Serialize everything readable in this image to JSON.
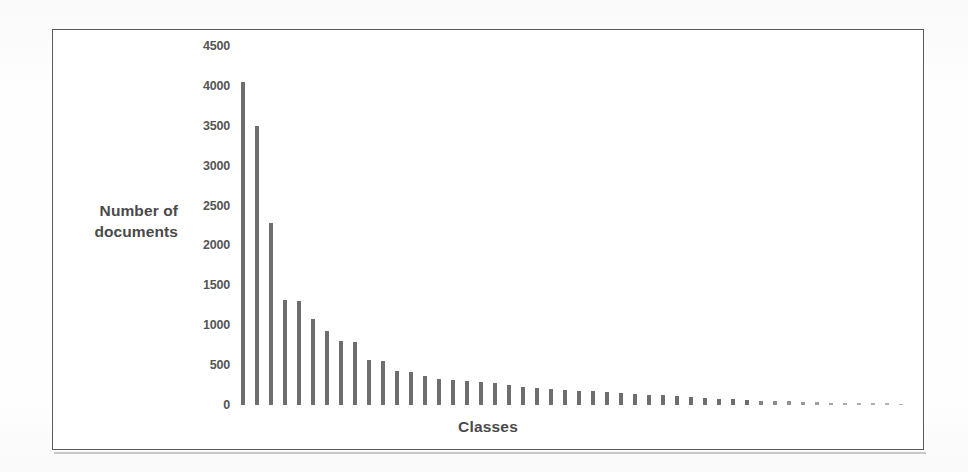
{
  "figure": {
    "frame_color": "#5b5b5b",
    "background": "#ffffff",
    "bar_color": "#6e6e6e",
    "text_color": "#4a4a4a"
  },
  "axes": {
    "y_title_line1": "Number of",
    "y_title_line2": "documents",
    "x_title": "Classes",
    "y_ticks": [
      "4500",
      "4000",
      "3500",
      "3000",
      "2500",
      "2000",
      "1500",
      "1000",
      "500",
      "0"
    ]
  },
  "chart_data": {
    "type": "bar",
    "title": "",
    "subtitle": "",
    "xlabel": "Classes",
    "ylabel": "Number of documents",
    "ylim": [
      0,
      4500
    ],
    "ytick_values": [
      0,
      500,
      1000,
      1500,
      2000,
      2500,
      3000,
      3500,
      4000,
      4500
    ],
    "grid": false,
    "legend": false,
    "legend_position": "none",
    "xtick_labels": [],
    "annotations": [],
    "note": "Long-tailed (Zipf-like) distribution of number of documents per class; classes sorted in descending order of document count. X axis categories are unlabeled.",
    "categories": [
      "1",
      "2",
      "3",
      "4",
      "5",
      "6",
      "7",
      "8",
      "9",
      "10",
      "11",
      "12",
      "13",
      "14",
      "15",
      "16",
      "17",
      "18",
      "19",
      "20",
      "21",
      "22",
      "23",
      "24",
      "25",
      "26",
      "27",
      "28",
      "29",
      "30",
      "31",
      "32",
      "33",
      "34",
      "35",
      "36",
      "37",
      "38",
      "39",
      "40",
      "41",
      "42",
      "43",
      "44",
      "45",
      "46",
      "47",
      "48"
    ],
    "values": [
      4050,
      3500,
      2280,
      1320,
      1300,
      1080,
      930,
      800,
      790,
      560,
      550,
      430,
      410,
      360,
      330,
      310,
      300,
      290,
      270,
      250,
      230,
      210,
      200,
      190,
      180,
      170,
      160,
      150,
      140,
      130,
      120,
      110,
      100,
      90,
      80,
      70,
      60,
      55,
      50,
      45,
      40,
      35,
      30,
      28,
      25,
      22,
      20,
      18
    ]
  }
}
